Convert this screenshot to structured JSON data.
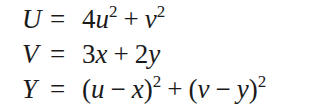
{
  "equations": [
    {
      "lhs": "U",
      "eq": "=",
      "rhs": [
        {
          "t": "num",
          "v": "4"
        },
        {
          "t": "var",
          "v": "u"
        },
        {
          "t": "sup",
          "v": "2"
        },
        {
          "t": "op",
          "v": "+"
        },
        {
          "t": "var",
          "v": "v"
        },
        {
          "t": "sup",
          "v": "2"
        }
      ],
      "text": "U = 4u^2 + v^2"
    },
    {
      "lhs": "V",
      "eq": "=",
      "rhs": [
        {
          "t": "num",
          "v": "3"
        },
        {
          "t": "var",
          "v": "x"
        },
        {
          "t": "op",
          "v": "+"
        },
        {
          "t": "num",
          "v": "2"
        },
        {
          "t": "var",
          "v": "y"
        }
      ],
      "text": "V = 3x + 2y"
    },
    {
      "lhs": "Y",
      "eq": "=",
      "rhs": [
        {
          "t": "paren",
          "v": "("
        },
        {
          "t": "var",
          "v": "u"
        },
        {
          "t": "op",
          "v": "−"
        },
        {
          "t": "var",
          "v": "x"
        },
        {
          "t": "paren",
          "v": ")"
        },
        {
          "t": "sup",
          "v": "2"
        },
        {
          "t": "op",
          "v": "+"
        },
        {
          "t": "paren",
          "v": "("
        },
        {
          "t": "var",
          "v": "v"
        },
        {
          "t": "op",
          "v": "−"
        },
        {
          "t": "var",
          "v": "y"
        },
        {
          "t": "paren",
          "v": ")"
        },
        {
          "t": "sup",
          "v": "2"
        }
      ],
      "text": "Y = (u − x)^2 + (v − y)^2"
    }
  ]
}
